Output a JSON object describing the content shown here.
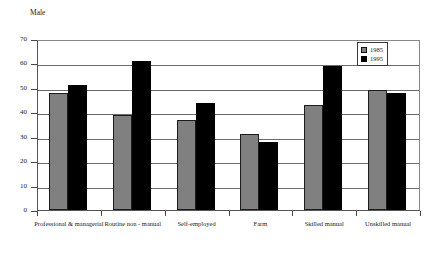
{
  "chart_data": {
    "type": "bar",
    "title": "Male",
    "xlabel": "",
    "ylabel": "",
    "ylim": [
      0,
      70
    ],
    "yticks": [
      0,
      10,
      20,
      30,
      40,
      50,
      60,
      70
    ],
    "grid": true,
    "legend_position": "top-right",
    "categories": [
      "Professional & managerial",
      "Routine non - manual",
      "Self-employed",
      "Farm",
      "Skilled manual",
      "Unskilled manual"
    ],
    "series": [
      {
        "name": "1985",
        "color": "#808080",
        "values": [
          48,
          39,
          37,
          31,
          43,
          49
        ]
      },
      {
        "name": "1995",
        "color": "#000000",
        "values": [
          51,
          61,
          44,
          28,
          59,
          48
        ]
      }
    ]
  },
  "legend": {
    "items": [
      {
        "label": "1985",
        "swatch": "series-1985-swatch"
      },
      {
        "label": "1995",
        "swatch": "series-1995-swatch"
      }
    ]
  }
}
